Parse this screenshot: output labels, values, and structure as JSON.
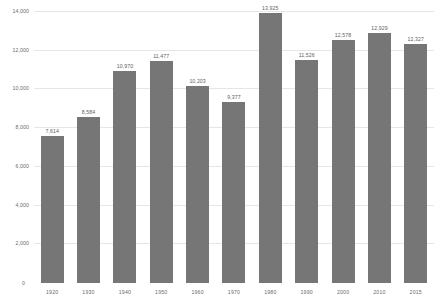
{
  "chart_data": {
    "type": "bar",
    "title": "",
    "subtitle": "",
    "xlabel": "",
    "ylabel": "",
    "categories": [
      "1920",
      "1930",
      "1940",
      "1950",
      "1960",
      "1970",
      "1980",
      "1990",
      "2000",
      "2010",
      "2015"
    ],
    "values": [
      7614,
      8584,
      10970,
      11477,
      10203,
      9377,
      13925,
      11526,
      12578,
      12929,
      12327
    ],
    "data_labels": [
      "7,614",
      "8,584",
      "10,970",
      "11,477",
      "10,203",
      "9,377",
      "13,925",
      "11,526",
      "12,578",
      "12,929",
      "12,327"
    ],
    "ylim": [
      0,
      14000
    ],
    "y_ticks": [
      2000,
      4000,
      6000,
      8000,
      10000,
      12000,
      14000
    ],
    "y_tick_labels": [
      "2,000",
      "4,000",
      "6,000",
      "8,000",
      "10,000",
      "12,000",
      "14,000"
    ],
    "zero_label": "0",
    "grid": true,
    "grid_axis": "y",
    "legend": false,
    "legend_position": "none",
    "bar_color": "#767676",
    "grid_color": "#e6e6e6",
    "background_color": "#ffffff",
    "text_color": "#6b6b6b"
  }
}
